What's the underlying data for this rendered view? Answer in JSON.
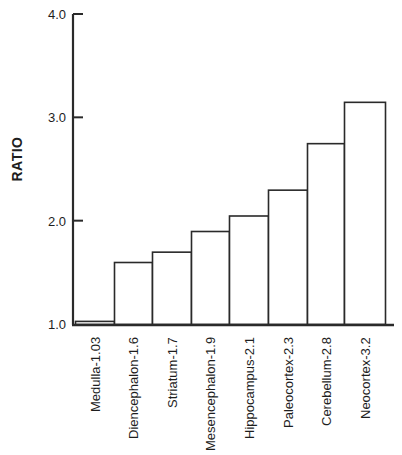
{
  "chart_data": {
    "type": "bar",
    "title": "",
    "xlabel": "",
    "ylabel": "RATIO",
    "ylim": [
      1.0,
      4.0
    ],
    "yticks": [
      1.0,
      2.0,
      3.0,
      4.0
    ],
    "ytick_labels": [
      "1.0",
      "2.0",
      "3.0",
      "4.0"
    ],
    "grid": false,
    "legend": null,
    "categories": [
      "Medulla-1.03",
      "Diencephalon-1.6",
      "Striatum-1.7",
      "Mesencephalon-1.9",
      "Hippocampus-2.1",
      "Paleocortex-2.3",
      "Cerebellum-2.8",
      "Neocortex-3.2"
    ],
    "values": [
      1.03,
      1.6,
      1.7,
      1.9,
      2.05,
      2.3,
      2.75,
      3.15
    ],
    "bar_fill": "#ffffff",
    "bar_stroke": "#2a2a2a",
    "axis_color": "#2a2a2a"
  }
}
